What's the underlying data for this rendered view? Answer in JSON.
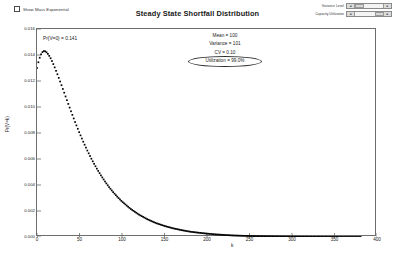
{
  "window": {
    "title": "Steady State Shortfall Distribution"
  },
  "toolbar": {
    "show_mass_exponential_label": "Show Mass Exponential",
    "show_mass_exponential_checked": false,
    "sliders": [
      {
        "label": "Variance Level",
        "left_arrow": "◄",
        "right_arrow": "►"
      },
      {
        "label": "Capacity Utilization",
        "left_arrow": "◄",
        "right_arrow": "►"
      }
    ]
  },
  "annotations": {
    "prob_zero": "Pr{V=0} = 0.141",
    "stats": [
      {
        "text": "Mean = 100",
        "highlighted": false
      },
      {
        "text": "Variance = 101",
        "highlighted": false
      },
      {
        "text": "CV = 0.10",
        "highlighted": false
      },
      {
        "text": "Utilization = 99.0%",
        "highlighted": true
      }
    ]
  },
  "chart_data": {
    "type": "scatter",
    "title": "Steady State Shortfall Distribution",
    "xlabel": "k",
    "ylabel": "Pr(V=k)",
    "xlim": [
      0,
      400
    ],
    "ylim": [
      0.0,
      0.016
    ],
    "grid": false,
    "legend": "none",
    "marker": "filled-square",
    "marker_color": "#000000",
    "xticks": [
      0,
      50,
      100,
      150,
      200,
      250,
      300,
      350,
      400
    ],
    "xtick_labels": [
      "0",
      "50",
      "100",
      "150",
      "200",
      "250",
      "300",
      "350",
      "400"
    ],
    "yticks": [
      0.0,
      0.002,
      0.004,
      0.006,
      0.008,
      0.01,
      0.012,
      0.014,
      0.016
    ],
    "ytick_labels": [
      "0.000",
      "0.002",
      "0.004",
      "0.006",
      "0.008",
      "0.010",
      "0.012",
      "0.014",
      "0.016"
    ],
    "series": [
      {
        "name": "Pr(V=k)",
        "x": [
          0,
          2,
          4,
          6,
          8,
          10,
          12,
          14,
          16,
          18,
          20,
          24,
          28,
          32,
          36,
          40,
          45,
          50,
          55,
          60,
          65,
          70,
          75,
          80,
          85,
          90,
          95,
          100,
          110,
          120,
          130,
          140,
          150,
          160,
          170,
          180,
          190,
          200,
          210,
          220,
          230,
          240,
          250,
          260,
          270,
          280,
          290,
          300,
          310,
          320,
          330,
          340,
          350,
          360,
          370,
          380
        ],
        "y": [
          0.013,
          0.01355,
          0.01395,
          0.0142,
          0.0143,
          0.01428,
          0.01416,
          0.01398,
          0.01375,
          0.01348,
          0.01318,
          0.01252,
          0.01182,
          0.0111,
          0.01038,
          0.00967,
          0.00881,
          0.008,
          0.00724,
          0.00654,
          0.00589,
          0.0053,
          0.00476,
          0.00427,
          0.00382,
          0.00342,
          0.00306,
          0.00273,
          0.00217,
          0.00172,
          0.00136,
          0.00107,
          0.00085,
          0.00067,
          0.00053,
          0.00041,
          0.00033,
          0.00026,
          0.0002,
          0.00016,
          0.00012,
          9.7e-05,
          7.6e-05,
          6e-05,
          4.7e-05,
          3.7e-05,
          2.9e-05,
          2.3e-05,
          1.8e-05,
          1.4e-05,
          1.1e-05,
          8.6e-06,
          6.8e-06,
          5.3e-06,
          4.2e-06,
          3.3e-06
        ]
      }
    ],
    "stats_summary": {
      "mean": 100,
      "variance": 101,
      "cv": 0.1,
      "utilization_pct": 99.0,
      "prob_zero": 0.141
    }
  }
}
